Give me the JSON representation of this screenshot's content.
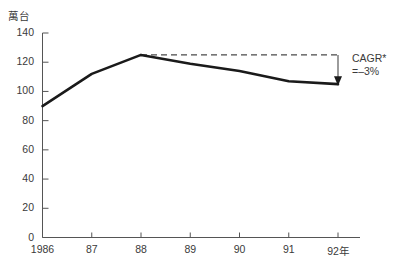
{
  "chart_data": {
    "type": "line",
    "title": "",
    "subtitle": "",
    "xlabel": "",
    "ylabel": "萬台",
    "unit_label": "萬台",
    "categories": [
      "1986",
      "87",
      "88",
      "89",
      "90",
      "91",
      "92年"
    ],
    "x": [
      1986,
      1987,
      1988,
      1989,
      1990,
      1991,
      1992
    ],
    "values": [
      90,
      112,
      125,
      119,
      114,
      107,
      105
    ],
    "series": [
      {
        "name": "台数",
        "values": [
          90,
          112,
          125,
          119,
          114,
          107,
          105
        ]
      }
    ],
    "ylim": [
      0,
      140
    ],
    "xlim": [
      1986,
      1992
    ],
    "yticks": [
      0,
      20,
      40,
      60,
      80,
      100,
      120,
      140
    ],
    "ytick_labels": [
      "0",
      "20",
      "40",
      "60",
      "80",
      "100",
      "120",
      "140"
    ],
    "xtick_labels": [
      "1986",
      "87",
      "88",
      "89",
      "90",
      "91",
      "92年"
    ],
    "grid": false,
    "legend": "none",
    "line_color": "#1a1a1a",
    "axis_color": "#555555",
    "reference_line": {
      "style": "dashed",
      "value": 125,
      "from_category": "88",
      "to_category": "92年",
      "color": "#4a4a4a"
    },
    "annotations": [
      {
        "name": "cagr",
        "line1": "CAGR*",
        "line2": "=–3%",
        "arrow": "down",
        "from_value": 125,
        "to_value": 105
      }
    ]
  },
  "annotation": {
    "cagr_label": "CAGR*",
    "cagr_value": "=–3%"
  },
  "axis": {
    "unit": "萬台"
  }
}
